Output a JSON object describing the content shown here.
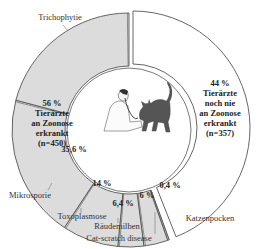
{
  "chart_data": {
    "type": "pie",
    "variant": "donut",
    "title": "",
    "groups": [
      {
        "name": "Tierärzte an Zoonose erkrankt",
        "percent": 56,
        "n": 450,
        "label_lines": [
          "56 %",
          "Tierärzte",
          "an Zoonose",
          "erkrankt",
          "(n=450)"
        ],
        "color": "#dcdcdc",
        "subcategories": [
          {
            "name": "Katzenpocken",
            "percent": 0.4,
            "label": "0,4 %"
          },
          {
            "name": "Cat-scratch disease",
            "percent": 6,
            "label": "6 %"
          },
          {
            "name": "Räudemilben",
            "percent": 6.4,
            "label": "6,4 %"
          },
          {
            "name": "Toxoplasmose",
            "percent": 14,
            "label": "14 %"
          },
          {
            "name": "Mikrosporie",
            "percent": 35.6,
            "label": "35,6 %"
          },
          {
            "name": "Trichophytie",
            "percent": 37.6,
            "label": ""
          }
        ]
      },
      {
        "name": "Tierärzte noch nie an Zoonose erkrankt",
        "percent": 44,
        "n": 357,
        "label_lines": [
          "44 %",
          "Tierärzte",
          "noch nie",
          "an Zoonose",
          "erkrankt",
          "(n=357)"
        ],
        "color": "#ffffff"
      }
    ],
    "center_image": "veterinarian-examining-cat-illustration"
  }
}
